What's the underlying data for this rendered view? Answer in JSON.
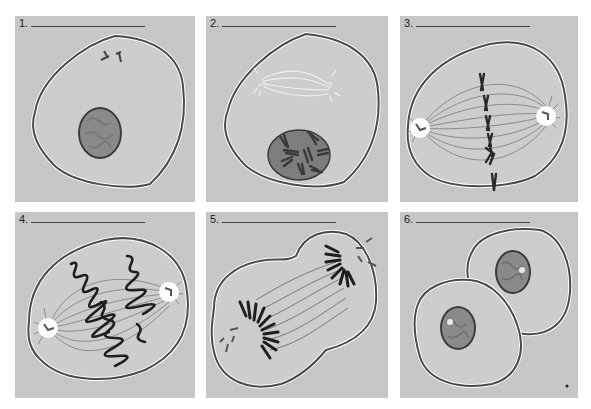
{
  "figure": {
    "colors": {
      "background": "#ffffff",
      "panel": "#c6c6c6",
      "cytoplasm": "#cdcdcd",
      "membrane": "#4a4a4a",
      "nucleus": "#8a8a8a",
      "chromosome": "#2a2a2a",
      "spindle": "#8c8c8c",
      "centrosome": "#ffffff"
    },
    "panels": [
      {
        "number": "1.",
        "blank": "",
        "depicts": "interphase cell with nucleus and centrioles"
      },
      {
        "number": "2.",
        "blank": "",
        "depicts": "prophase: condensing chromosomes, forming spindle"
      },
      {
        "number": "3.",
        "blank": "",
        "depicts": "metaphase: chromosomes aligned at equator"
      },
      {
        "number": "4.",
        "blank": "",
        "depicts": "anaphase: chromatids moving to poles"
      },
      {
        "number": "5.",
        "blank": "",
        "depicts": "telophase: cleavage furrow forming"
      },
      {
        "number": "6.",
        "blank": "",
        "depicts": "two daughter cells (cytokinesis complete)"
      }
    ]
  }
}
